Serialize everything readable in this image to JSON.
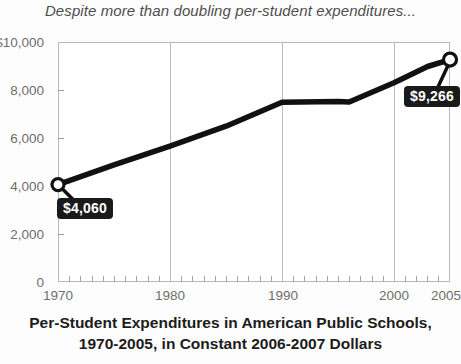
{
  "chart_data": {
    "type": "line",
    "title": "Despite more than doubling per-student expenditures...",
    "caption_line1": "Per-Student Expenditures in American Public Schools,",
    "caption_line2": "1970-2005, in Constant 2006-2007 Dollars",
    "xlabel": "",
    "ylabel": "",
    "xlim": [
      1970,
      2005
    ],
    "ylim": [
      0,
      10000
    ],
    "grid": "vertical-decades",
    "legend": "none",
    "x_tick_labels": [
      "1970",
      "1980",
      "1990",
      "2000",
      "2005"
    ],
    "x_tick_values": [
      1970,
      1980,
      1990,
      2000,
      2005
    ],
    "y_tick_labels": [
      "$10,000",
      "8,000",
      "6,000",
      "4,000",
      "2,000",
      "0"
    ],
    "y_tick_values": [
      10000,
      8000,
      6000,
      4000,
      2000,
      0
    ],
    "series": [
      {
        "name": "Per-student expenditures",
        "x": [
          1970,
          1975,
          1980,
          1985,
          1990,
          1995,
          1996,
          2000,
          2003,
          2005
        ],
        "values": [
          4060,
          4880,
          5660,
          6490,
          7490,
          7520,
          7500,
          8300,
          8980,
          9266
        ]
      }
    ],
    "annotations": [
      {
        "name": "start-value",
        "x": 1970,
        "y": 4060,
        "text": "$4,060"
      },
      {
        "name": "end-value",
        "x": 2005,
        "y": 9266,
        "text": "$9,266"
      }
    ],
    "markers": [
      {
        "x": 1970,
        "y": 4060
      },
      {
        "x": 2005,
        "y": 9266
      }
    ],
    "colors": {
      "line": "#111111",
      "marker_fill": "#ffffff",
      "marker_stroke": "#111111",
      "label_background": "#1a1a1a",
      "label_text": "#ffffff",
      "grid": "#bdbdbd",
      "axis_text": "#6e6e6e",
      "title_text": "#4d4d4d"
    }
  }
}
